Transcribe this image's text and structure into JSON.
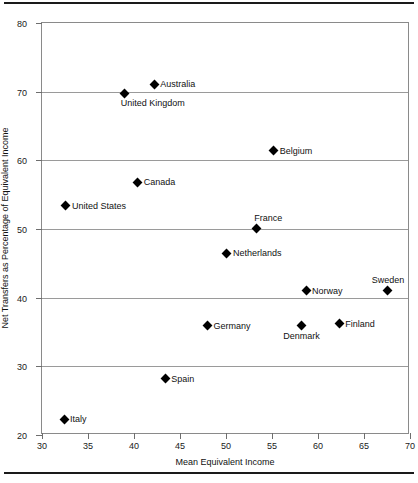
{
  "chart_data": {
    "type": "scatter",
    "title": "",
    "xlabel": "Mean Equivalent Income",
    "ylabel": "Net Transfers as Percentage of Equivalent Income",
    "xlim": [
      30,
      70
    ],
    "ylim": [
      20,
      80
    ],
    "xticks": [
      30,
      35,
      40,
      45,
      50,
      55,
      60,
      65,
      70
    ],
    "yticks": [
      20,
      30,
      40,
      50,
      60,
      70,
      80
    ],
    "grid": "horizontal",
    "legend": "none",
    "marker": "filled-diamond",
    "marker_color": "#000000",
    "points": [
      {
        "label": "Australia",
        "x": 42.2,
        "y": 71.1,
        "label_pos": "right"
      },
      {
        "label": "United Kingdom",
        "x": 39.0,
        "y": 69.8,
        "label_pos": "below-right"
      },
      {
        "label": "Belgium",
        "x": 55.2,
        "y": 61.4,
        "label_pos": "right"
      },
      {
        "label": "Canada",
        "x": 40.4,
        "y": 56.8,
        "label_pos": "right"
      },
      {
        "label": "United States",
        "x": 32.6,
        "y": 53.4,
        "label_pos": "right"
      },
      {
        "label": "France",
        "x": 53.3,
        "y": 50.1,
        "label_pos": "above-right"
      },
      {
        "label": "Netherlands",
        "x": 50.1,
        "y": 46.5,
        "label_pos": "right"
      },
      {
        "label": "Norway",
        "x": 58.7,
        "y": 41.0,
        "label_pos": "right"
      },
      {
        "label": "Sweden",
        "x": 67.6,
        "y": 41.1,
        "label_pos": "above"
      },
      {
        "label": "Germany",
        "x": 48.0,
        "y": 35.9,
        "label_pos": "right"
      },
      {
        "label": "Denmark",
        "x": 58.2,
        "y": 35.9,
        "label_pos": "below"
      },
      {
        "label": "Finland",
        "x": 62.3,
        "y": 36.2,
        "label_pos": "right"
      },
      {
        "label": "Spain",
        "x": 43.4,
        "y": 28.2,
        "label_pos": "right"
      },
      {
        "label": "Italy",
        "x": 32.4,
        "y": 22.3,
        "label_pos": "right"
      }
    ]
  },
  "figure": {
    "xtick_labels": [
      "30",
      "35",
      "40",
      "45",
      "50",
      "55",
      "60",
      "65",
      "70"
    ],
    "ytick_labels": [
      "20",
      "30",
      "40",
      "50",
      "60",
      "70",
      "80"
    ],
    "grid_values": [
      30,
      40,
      50,
      60,
      70
    ],
    "frame_color": "#8a8a8a",
    "grid_color": "#9a9a9a",
    "rule_color": "#1a1a1a"
  }
}
